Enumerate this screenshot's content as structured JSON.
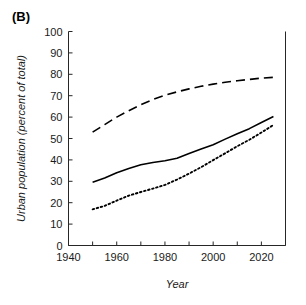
{
  "figure": {
    "panel_label": "(B)"
  },
  "chart_data": {
    "type": "line",
    "title": "",
    "xlabel": "Year",
    "ylabel": "Urban population (percent of total)",
    "xlim": [
      1940,
      2030
    ],
    "ylim": [
      0,
      100
    ],
    "xticks": [
      1940,
      1950,
      1960,
      1970,
      1980,
      1990,
      2000,
      2010,
      2020,
      2030
    ],
    "xtick_labels": [
      "1940",
      "",
      "1960",
      "",
      "1980",
      "",
      "2000",
      "",
      "2020",
      ""
    ],
    "yticks": [
      0,
      10,
      20,
      30,
      40,
      50,
      60,
      70,
      80,
      90,
      100
    ],
    "ytick_labels": [
      "0",
      "10",
      "20",
      "30",
      "40",
      "50",
      "60",
      "70",
      "80",
      "90",
      "100"
    ],
    "grid": false,
    "legend": "none",
    "line_color": "#000000",
    "series": [
      {
        "name": "dashed-series",
        "style": "dashed",
        "x": [
          1950,
          1955,
          1960,
          1965,
          1970,
          1975,
          1980,
          1985,
          1990,
          1995,
          2000,
          2005,
          2010,
          2015,
          2020,
          2025
        ],
        "values": [
          53.0,
          56.5,
          60.0,
          63.0,
          65.8,
          68.2,
          70.2,
          71.8,
          73.2,
          74.4,
          75.4,
          76.3,
          77.0,
          77.6,
          78.2,
          78.6
        ]
      },
      {
        "name": "solid-series",
        "style": "solid",
        "x": [
          1950,
          1955,
          1960,
          1965,
          1970,
          1975,
          1980,
          1985,
          1990,
          1995,
          2000,
          2005,
          2010,
          2015,
          2020,
          2025
        ],
        "values": [
          29.6,
          31.5,
          34.0,
          36.0,
          37.7,
          38.8,
          39.6,
          40.8,
          43.0,
          45.1,
          47.1,
          49.7,
          52.2,
          54.6,
          57.5,
          60.3
        ]
      },
      {
        "name": "dotted-series",
        "style": "dotted",
        "x": [
          1950,
          1955,
          1960,
          1965,
          1970,
          1975,
          1980,
          1985,
          1990,
          1995,
          2000,
          2005,
          2010,
          2015,
          2020,
          2025
        ],
        "values": [
          16.9,
          18.5,
          21.0,
          23.3,
          25.0,
          26.6,
          28.3,
          30.8,
          33.6,
          36.6,
          39.9,
          43.1,
          46.4,
          49.4,
          52.8,
          56.3
        ]
      }
    ]
  }
}
